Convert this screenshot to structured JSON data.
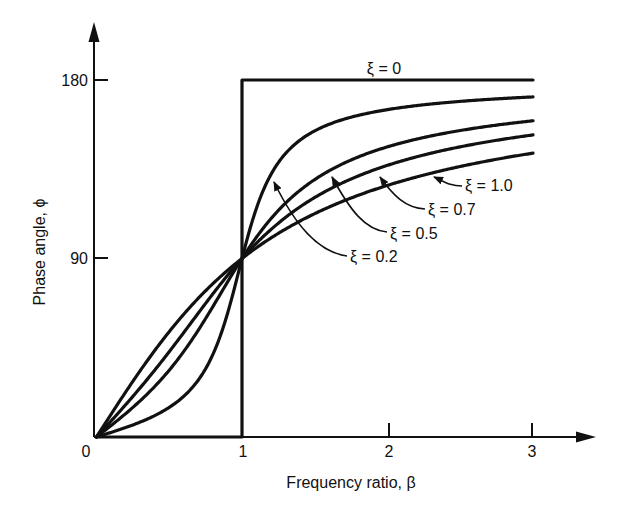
{
  "chart_data": {
    "type": "line",
    "title": "",
    "xlabel": "Frequency ratio, β",
    "ylabel": "Phase angle, ϕ",
    "xlim": [
      0,
      3
    ],
    "ylim": [
      0,
      180
    ],
    "x_ticks": [
      {
        "value": 0,
        "label": "0"
      },
      {
        "value": 1,
        "label": "1"
      },
      {
        "value": 2,
        "label": "2"
      },
      {
        "value": 3,
        "label": "3"
      }
    ],
    "y_ticks": [
      {
        "value": 90,
        "label": "90"
      },
      {
        "value": 180,
        "label": "180"
      }
    ],
    "grid": false,
    "legend": "inline annotations with arrows",
    "x": [
      0,
      0.25,
      0.5,
      0.75,
      1.0,
      1.25,
      1.5,
      2.0,
      2.5,
      3.0
    ],
    "series": [
      {
        "name": "ξ = 0",
        "label": "ξ = 0",
        "zeta": 0,
        "values": [
          0,
          0,
          0,
          0,
          90,
          180,
          180,
          180,
          180,
          180
        ]
      },
      {
        "name": "ξ = 0.2",
        "label": "ξ = 0.2",
        "zeta": 0.2,
        "values": [
          0,
          6.1,
          14.9,
          34.5,
          90,
          138.4,
          154.4,
          165.1,
          169.2,
          171.5
        ]
      },
      {
        "name": "ξ = 0.5",
        "label": "ξ = 0.5",
        "zeta": 0.5,
        "values": [
          0,
          14.9,
          33.7,
          59.7,
          90,
          114.0,
          129.8,
          146.3,
          153.4,
          159.4
        ]
      },
      {
        "name": "ξ = 0.7",
        "label": "ξ = 0.7",
        "zeta": 0.7,
        "values": [
          0,
          20.5,
          43.0,
          67.4,
          90,
          108.4,
          122.2,
          137.0,
          144.5,
          151.7
        ]
      },
      {
        "name": "ξ = 1.0",
        "label": "ξ = 1.0",
        "zeta": 1.0,
        "values": [
          0,
          28.1,
          53.1,
          73.7,
          90,
          102.7,
          112.6,
          126.9,
          136.4,
          143.1
        ]
      }
    ],
    "annotations": [
      {
        "text": "ξ = 0",
        "target": "ξ = 0"
      },
      {
        "text": "ξ = 1.0",
        "target": "ξ = 1.0"
      },
      {
        "text": "ξ = 0.7",
        "target": "ξ = 0.7"
      },
      {
        "text": "ξ = 0.5",
        "target": "ξ = 0.5"
      },
      {
        "text": "ξ = 0.2",
        "target": "ξ = 0.2"
      }
    ]
  },
  "labels": {
    "xlabel": "Frequency ratio, β",
    "ylabel": "Phase angle, ϕ",
    "origin": "0",
    "x1": "1",
    "x2": "2",
    "x3": "3",
    "y90": "90",
    "y180": "180",
    "z0": "ξ = 0",
    "z10": "ξ = 1.0",
    "z07": "ξ = 0.7",
    "z05": "ξ = 0.5",
    "z02": "ξ = 0.2"
  }
}
